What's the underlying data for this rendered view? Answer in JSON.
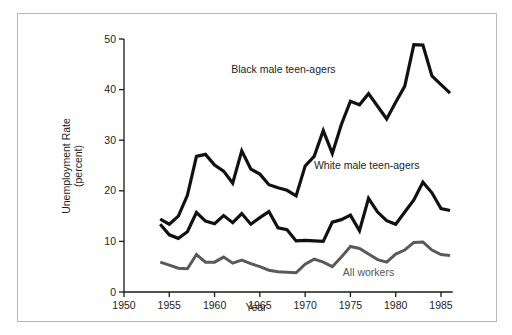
{
  "figure": {
    "background_color": "#ffffff",
    "frame_color": "#b9b9b9"
  },
  "chart_data": {
    "type": "line",
    "title": "",
    "xlabel": "Year",
    "ylabel": "Unemployment Rate (percent)",
    "ylabel_line1": "Unemployment Rate",
    "ylabel_line2": "(percent)",
    "xlim": [
      1950,
      1987
    ],
    "ylim": [
      0,
      50
    ],
    "xticks": [
      1950,
      1955,
      1960,
      1965,
      1970,
      1975,
      1980,
      1985
    ],
    "xtick_labels": [
      "1950",
      "1955",
      "1960",
      "1965",
      "1970",
      "1975",
      "1980",
      "1985"
    ],
    "yticks": [
      0,
      10,
      20,
      30,
      40,
      50
    ],
    "ytick_labels": [
      "0",
      "10",
      "20",
      "30",
      "40",
      "50"
    ],
    "grid": false,
    "legend_position": "inline-annotations",
    "x": [
      1954,
      1955,
      1956,
      1957,
      1958,
      1959,
      1960,
      1961,
      1962,
      1963,
      1964,
      1965,
      1966,
      1967,
      1968,
      1969,
      1970,
      1971,
      1972,
      1973,
      1974,
      1975,
      1976,
      1977,
      1978,
      1979,
      1980,
      1981,
      1982,
      1983,
      1984,
      1985,
      1986
    ],
    "series": [
      {
        "name": "Black male teen-agers",
        "color": "#111111",
        "width": 3.2,
        "label_x": 1967.6,
        "label_y": 43.2,
        "values": [
          14.4,
          13.4,
          15.0,
          19.1,
          26.8,
          27.2,
          25.1,
          23.9,
          21.5,
          27.9,
          24.3,
          23.3,
          21.2,
          20.6,
          20.1,
          19.0,
          24.9,
          26.8,
          31.9,
          27.4,
          33.1,
          37.7,
          37.0,
          39.2,
          36.7,
          34.2,
          37.5,
          40.7,
          48.9,
          48.8,
          42.7,
          41.0,
          39.3
        ]
      },
      {
        "name": "White male teen-agers",
        "color": "#111111",
        "width": 3.2,
        "label_x": 1976.8,
        "label_y": 24.3,
        "values": [
          13.4,
          11.3,
          10.6,
          11.9,
          15.7,
          14.0,
          13.5,
          15.1,
          13.7,
          15.5,
          13.4,
          14.7,
          15.9,
          12.7,
          12.3,
          10.1,
          10.2,
          10.1,
          10.0,
          13.8,
          14.3,
          15.2,
          12.1,
          18.5,
          15.8,
          14.1,
          13.4,
          15.8,
          18.2,
          21.7,
          19.6,
          16.5,
          16.1
        ]
      },
      {
        "name": "All workers",
        "color": "#5a5a5a",
        "width": 3.0,
        "label_x": 1977.0,
        "label_y": 3.1,
        "values": [
          5.9,
          5.3,
          4.7,
          4.6,
          7.4,
          5.9,
          5.9,
          6.9,
          5.7,
          6.3,
          5.6,
          5.0,
          4.3,
          4.0,
          3.9,
          3.8,
          5.5,
          6.5,
          5.9,
          5.0,
          6.9,
          9.0,
          8.6,
          7.5,
          6.4,
          5.9,
          7.5,
          8.3,
          9.8,
          9.9,
          8.3,
          7.4,
          7.2
        ]
      }
    ]
  }
}
